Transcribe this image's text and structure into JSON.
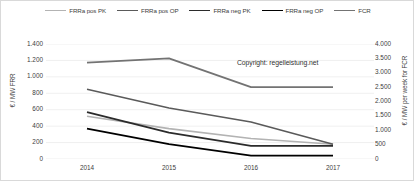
{
  "chart_data": {
    "type": "line",
    "title": "",
    "xlabel": "",
    "ylabel": "€ / MW  FRR",
    "y2label": "€ / MW per week for FCR",
    "categories": [
      "2014",
      "2015",
      "2016",
      "2017"
    ],
    "x": [
      2014,
      2015,
      2016,
      2017
    ],
    "ylim": [
      0,
      1400
    ],
    "y2lim": [
      0,
      4000
    ],
    "yticks": [
      "0",
      "200",
      "400",
      "600",
      "800",
      "1.000",
      "1.200",
      "1.400"
    ],
    "ytick_values": [
      0,
      200,
      400,
      600,
      800,
      1000,
      1200,
      1400
    ],
    "y2ticks": [
      "0",
      "500",
      "1.000",
      "1.500",
      "2.000",
      "2.500",
      "3.000",
      "3.500",
      "4.000"
    ],
    "y2tick_values": [
      0,
      500,
      1000,
      1500,
      2000,
      2500,
      3000,
      3500,
      4000
    ],
    "grid": true,
    "legend_position": "top",
    "annotations": [
      {
        "text": "Copyright: regelleistung.net"
      }
    ],
    "series": [
      {
        "name": "FRRa pos PK",
        "axis": "left",
        "color": "#b3b3b3",
        "width": 1.6,
        "values": [
          520,
          370,
          250,
          180
        ]
      },
      {
        "name": "FRRa pos OP",
        "axis": "left",
        "color": "#5a5a5a",
        "width": 1.6,
        "values": [
          850,
          620,
          450,
          180
        ]
      },
      {
        "name": "FRRa neg PK",
        "axis": "left",
        "color": "#2b2b2b",
        "width": 1.8,
        "values": [
          570,
          320,
          160,
          160
        ]
      },
      {
        "name": "FRRa neg OP",
        "axis": "left",
        "color": "#000000",
        "width": 1.8,
        "values": [
          370,
          180,
          40,
          40
        ]
      },
      {
        "name": "FCR",
        "axis": "right",
        "color": "#737373",
        "width": 1.8,
        "values": [
          3350,
          3500,
          2500,
          2500
        ]
      }
    ]
  },
  "legend": {
    "items": [
      {
        "label": "FRRa pos PK"
      },
      {
        "label": "FRRa pos OP"
      },
      {
        "label": "FRRa neg PK"
      },
      {
        "label": "FRRa neg OP"
      },
      {
        "label": "FCR"
      }
    ]
  },
  "copyright": {
    "text": "Copyright: regelleistung.net"
  }
}
